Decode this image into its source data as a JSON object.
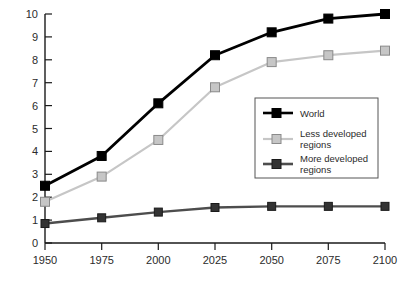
{
  "chart_data": {
    "type": "line",
    "title": "",
    "subtitle": "",
    "xlabel": "",
    "ylabel": "",
    "x": [
      1950,
      1975,
      2000,
      2025,
      2050,
      2075,
      2100
    ],
    "categories": [
      "1950",
      "1975",
      "2000",
      "2025",
      "2050",
      "2075",
      "2100"
    ],
    "xlim": [
      1950,
      2100
    ],
    "ylim": [
      0,
      10
    ],
    "xticks": [
      "1950",
      "1975",
      "2000",
      "2025",
      "2050",
      "2075",
      "2100"
    ],
    "yticks": [
      "0",
      "1",
      "2",
      "3",
      "4",
      "5",
      "6",
      "7",
      "8",
      "9",
      "10"
    ],
    "grid": false,
    "legend_position": "center-right",
    "series": [
      {
        "name": "World",
        "color": "#000000",
        "marker": "square-filled",
        "values": [
          2.5,
          3.8,
          6.1,
          8.2,
          9.2,
          9.8,
          10.0
        ]
      },
      {
        "name": "Less developed regions",
        "color": "#c6c6c6",
        "marker": "square-filled",
        "values": [
          1.8,
          2.9,
          4.5,
          6.8,
          7.9,
          8.2,
          8.4
        ]
      },
      {
        "name": "More developed regions",
        "color": "#4d4d4d",
        "marker": "square-filled",
        "values": [
          0.85,
          1.1,
          1.35,
          1.55,
          1.6,
          1.6,
          1.6
        ]
      }
    ]
  },
  "legend": {
    "entries": [
      {
        "label": "World"
      },
      {
        "label": "Less developed",
        "label2": "regions"
      },
      {
        "label": "More developed",
        "label2": "regions"
      }
    ]
  },
  "axes": {
    "y_tick_0": "0",
    "y_tick_1": "1",
    "y_tick_2": "2",
    "y_tick_3": "3",
    "y_tick_4": "4",
    "y_tick_5": "5",
    "y_tick_6": "6",
    "y_tick_7": "7",
    "y_tick_8": "8",
    "y_tick_9": "9",
    "y_tick_10": "10",
    "x_tick_0": "1950",
    "x_tick_1": "1975",
    "x_tick_2": "2000",
    "x_tick_3": "2025",
    "x_tick_4": "2050",
    "x_tick_5": "2075",
    "x_tick_6": "2100"
  }
}
